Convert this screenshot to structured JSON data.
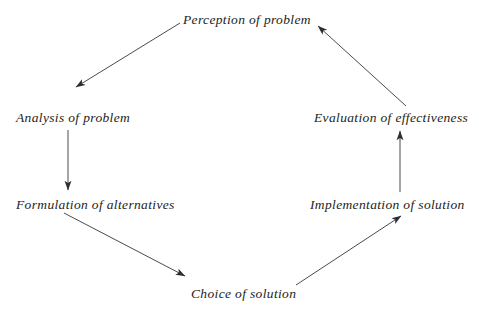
{
  "diagram": {
    "type": "cycle-flow-diagram",
    "background_color": "#ffffff",
    "text_color": "#1d1d20",
    "arrow_color": "#3a3a42",
    "nodes": [
      {
        "id": "perception",
        "label": "Perception of problem"
      },
      {
        "id": "analysis",
        "label": "Analysis of problem"
      },
      {
        "id": "formulation",
        "label": "Formulation of alternatives"
      },
      {
        "id": "choice",
        "label": "Choice of solution"
      },
      {
        "id": "implementation",
        "label": "Implementation of solution"
      },
      {
        "id": "evaluation",
        "label": "Evaluation of effectiveness"
      }
    ],
    "edges": [
      {
        "from": "perception",
        "to": "analysis",
        "direction": "down-left"
      },
      {
        "from": "analysis",
        "to": "formulation",
        "direction": "down"
      },
      {
        "from": "formulation",
        "to": "choice",
        "direction": "down-right"
      },
      {
        "from": "choice",
        "to": "implementation",
        "direction": "up-right"
      },
      {
        "from": "implementation",
        "to": "evaluation",
        "direction": "up"
      },
      {
        "from": "evaluation",
        "to": "perception",
        "direction": "up-left"
      }
    ]
  }
}
